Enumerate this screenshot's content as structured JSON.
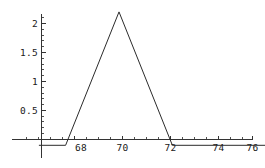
{
  "chart_data": {
    "type": "line",
    "title": "",
    "subtitle": "",
    "xlabel": "",
    "ylabel": "",
    "grid": false,
    "legend": false,
    "legend_position": "none",
    "xlim": [
      66.4,
      76.7
    ],
    "ylim": [
      -0.12,
      2.35
    ],
    "x_ticks": [
      68,
      70,
      72,
      74,
      76
    ],
    "x_tick_labels": [
      "68",
      "70",
      "72",
      "74",
      "76"
    ],
    "y_ticks": [
      0.5,
      1,
      1.5,
      2
    ],
    "y_tick_labels": [
      "0.5",
      "1",
      "1.5",
      "2"
    ],
    "x_minor_tick_count_between": 3,
    "y_minor_tick_count_between": 4,
    "series": [
      {
        "name": "triangular-membership",
        "color": "#2b2b2b",
        "x": [
          66.4,
          67.6,
          70.0,
          72.4,
          76.7
        ],
        "values": [
          -0.1,
          -0.1,
          2.2,
          -0.1,
          -0.1
        ]
      }
    ],
    "annotations": [],
    "peak": {
      "x": 70.0,
      "y": 2.2
    },
    "baseline": -0.1,
    "left_foot_x": 67.6,
    "right_foot_x": 72.4
  },
  "axes": {
    "x_axis_name": "x-axis",
    "y_axis_name": "y-axis",
    "axis_color": "#333333"
  }
}
